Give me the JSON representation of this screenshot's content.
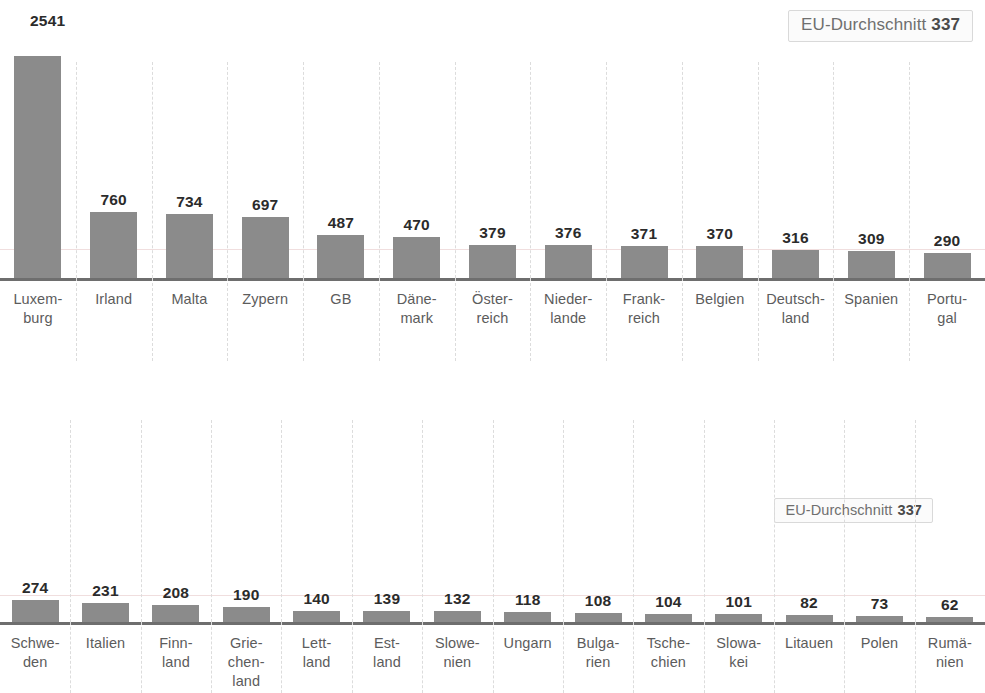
{
  "header": {
    "max_value_label": "2541",
    "avg_badge_top": {
      "text": "EU-Durchschnitt",
      "value": "337"
    },
    "avg_badge_bottom": {
      "text": "EU-Durchschnitt",
      "value": "337"
    }
  },
  "colors": {
    "bar": "#8b8b8b",
    "axis": "#6e6e6e",
    "gridline": "#dcdcdc",
    "average_line": "#f0dede",
    "value_text": "#2b2b2b",
    "label_text": "#5c5c5c"
  },
  "chart_data": [
    {
      "type": "bar",
      "id": "top-row",
      "title": "",
      "xlabel": "",
      "ylabel": "",
      "grid": true,
      "legend": "EU-Durchschnitt 337",
      "annotations": [
        "2541",
        "EU-Durchschnitt 337"
      ],
      "average_line": 337,
      "ylim": [
        0,
        2541
      ],
      "categories": [
        "Luxemburg",
        "Irland",
        "Malta",
        "Zypern",
        "GB",
        "Dänemark",
        "Österreich",
        "Niederlande",
        "Frankreich",
        "Belgien",
        "Deutschland",
        "Spanien",
        "Portugal"
      ],
      "category_lines": [
        [
          "Luxem-",
          "burg"
        ],
        [
          "Irland"
        ],
        [
          "Malta"
        ],
        [
          "Zypern"
        ],
        [
          "GB"
        ],
        [
          "Däne-",
          "mark"
        ],
        [
          "Öster-",
          "reich"
        ],
        [
          "Nieder-",
          "lande"
        ],
        [
          "Frank-",
          "reich"
        ],
        [
          "Belgien"
        ],
        [
          "Deutsch-",
          "land"
        ],
        [
          "Spanien"
        ],
        [
          "Portu-",
          "gal"
        ]
      ],
      "values": [
        2541,
        760,
        734,
        697,
        487,
        470,
        379,
        376,
        371,
        370,
        316,
        309,
        290
      ],
      "value_labels": [
        "2541",
        "760",
        "734",
        "697",
        "487",
        "470",
        "379",
        "376",
        "371",
        "370",
        "316",
        "309",
        "290"
      ]
    },
    {
      "type": "bar",
      "id": "bottom-row",
      "title": "",
      "xlabel": "",
      "ylabel": "",
      "grid": true,
      "legend": "EU-Durchschnitt 337",
      "annotations": [
        "EU-Durchschnitt 337"
      ],
      "average_line": 337,
      "ylim": [
        0,
        2541
      ],
      "categories": [
        "Schweden",
        "Italien",
        "Finnland",
        "Griechenland",
        "Lettland",
        "Estland",
        "Slowenien",
        "Ungarn",
        "Bulgarien",
        "Tschechien",
        "Slowakei",
        "Litauen",
        "Polen",
        "Rumänien"
      ],
      "category_lines": [
        [
          "Schwe-",
          "den"
        ],
        [
          "Italien"
        ],
        [
          "Finn-",
          "land"
        ],
        [
          "Grie-",
          "chen-",
          "land"
        ],
        [
          "Lett-",
          "land"
        ],
        [
          "Est-",
          "land"
        ],
        [
          "Slowe-",
          "nien"
        ],
        [
          "Ungarn"
        ],
        [
          "Bulga-",
          "rien"
        ],
        [
          "Tsche-",
          "chien"
        ],
        [
          "Slowa-",
          "kei"
        ],
        [
          "Litauen"
        ],
        [
          "Polen"
        ],
        [
          "Rumä-",
          "nien"
        ]
      ],
      "values": [
        274,
        231,
        208,
        190,
        140,
        139,
        132,
        118,
        108,
        104,
        101,
        82,
        73,
        62
      ],
      "value_labels": [
        "274",
        "231",
        "208",
        "190",
        "140",
        "139",
        "132",
        "118",
        "108",
        "104",
        "101",
        "82",
        "73",
        "62"
      ]
    }
  ]
}
